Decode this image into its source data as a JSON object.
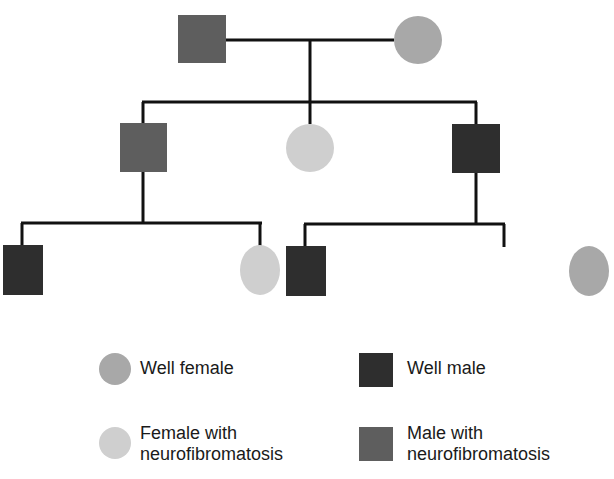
{
  "diagram": {
    "type": "pedigree",
    "colors": {
      "well_female": "#a8a8a8",
      "well_male": "#2e2e2e",
      "affected_female": "#cfcfcf",
      "affected_male": "#5e5e5e",
      "line": "#111111"
    },
    "generations": [
      {
        "level": 1,
        "individuals": [
          {
            "id": "g1-father",
            "sex": "male",
            "status": "affected"
          },
          {
            "id": "g1-mother",
            "sex": "female",
            "status": "well"
          }
        ]
      },
      {
        "level": 2,
        "individuals": [
          {
            "id": "g2-son-left",
            "sex": "male",
            "status": "affected"
          },
          {
            "id": "g2-daughter",
            "sex": "female",
            "status": "affected"
          },
          {
            "id": "g2-son-right",
            "sex": "male",
            "status": "well"
          }
        ]
      },
      {
        "level": 3,
        "individuals": [
          {
            "id": "g3-left-son",
            "sex": "male",
            "status": "well",
            "parent": "g2-son-left"
          },
          {
            "id": "g3-left-daughter",
            "sex": "female",
            "status": "affected",
            "parent": "g2-son-left"
          },
          {
            "id": "g3-right-son",
            "sex": "male",
            "status": "well",
            "parent": "g2-son-right"
          },
          {
            "id": "g3-right-daughter",
            "sex": "female",
            "status": "well",
            "parent": "g2-son-right"
          }
        ]
      }
    ]
  },
  "legend": {
    "well_female": "Well female",
    "well_male": "Well male",
    "affected_female": "Female with\nneurofibromatosis",
    "affected_male": "Male with\nneurofibromatosis"
  }
}
